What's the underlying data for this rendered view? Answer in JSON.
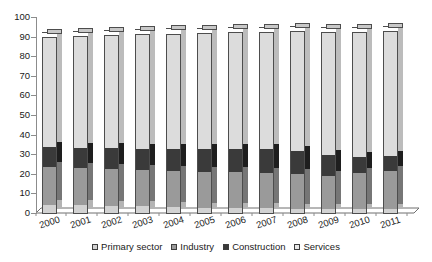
{
  "chart_data": {
    "type": "bar",
    "stacked": true,
    "stack_mode": "percent",
    "title": "",
    "subtitle": "",
    "xlabel": "",
    "ylabel": "",
    "ylim": [
      0,
      100
    ],
    "yticks": [
      0,
      10,
      20,
      30,
      40,
      50,
      60,
      70,
      80,
      90,
      100
    ],
    "ytick_labels": [
      "0",
      "10",
      "20",
      "30",
      "40",
      "50",
      "60",
      "70",
      "80",
      "90",
      "100"
    ],
    "grid": false,
    "legend_position": "bottom",
    "three_d": true,
    "categories": [
      "2000",
      "2001",
      "2002",
      "2003",
      "2004",
      "2005",
      "2006",
      "2007",
      "2008",
      "2009",
      "2010",
      "2011"
    ],
    "series": [
      {
        "name": "Primary sector",
        "color": "#d2d2d2",
        "values": [
          4.6,
          4.4,
          4.2,
          3.9,
          3.5,
          3.2,
          3.0,
          2.9,
          2.8,
          2.6,
          2.5,
          2.4
        ]
      },
      {
        "name": "Industry",
        "color": "#9a9a9a",
        "values": [
          19.6,
          19.3,
          18.8,
          18.7,
          18.5,
          18.3,
          18.2,
          18.1,
          17.6,
          17.0,
          18.3,
          19.6
        ]
      },
      {
        "name": "Construction",
        "color": "#3a3a3a",
        "values": [
          10.0,
          10.2,
          10.7,
          10.8,
          11.4,
          11.6,
          12.1,
          12.2,
          11.8,
          10.6,
          8.5,
          7.7
        ]
      },
      {
        "name": "Services",
        "color": "#dcdcdc",
        "values": [
          56.3,
          57.0,
          57.6,
          58.2,
          58.7,
          59.2,
          59.4,
          59.5,
          61.1,
          62.9,
          63.7,
          63.7
        ]
      }
    ],
    "bar_totals": [
      90.5,
      90.9,
      91.3,
      91.6,
      92.1,
      92.3,
      92.7,
      92.7,
      93.3,
      93.1,
      93.0,
      93.4
    ],
    "legend_items": [
      "Primary sector",
      "Industry",
      "Construction",
      "Services"
    ]
  },
  "axis": {
    "y_tick_labels": [
      "100",
      "90",
      "80",
      "70",
      "60",
      "50",
      "40",
      "30",
      "20",
      "10",
      "0"
    ]
  },
  "legend": {
    "items": [
      {
        "label": "Primary sector",
        "swatch": "primary"
      },
      {
        "label": "Industry",
        "swatch": "industry"
      },
      {
        "label": "Construction",
        "swatch": "construction"
      },
      {
        "label": "Services",
        "swatch": "services"
      }
    ]
  }
}
